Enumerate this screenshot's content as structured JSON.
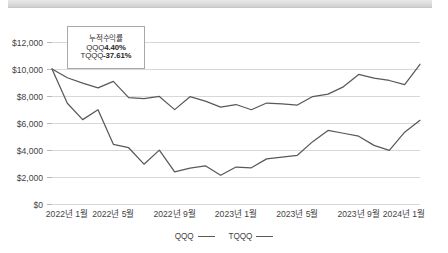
{
  "decor": {
    "top_bar_name": "top-scroll-bar"
  },
  "annotation": {
    "title": "누적수익률",
    "rows": [
      {
        "ticker": "QQQ",
        "value": "4.40%"
      },
      {
        "ticker": "TQQQ",
        "value": "-37.61%"
      }
    ]
  },
  "legend": {
    "items": [
      {
        "label": "QQQ",
        "color": "#595959"
      },
      {
        "label": "TQQQ",
        "color": "#595959"
      }
    ]
  },
  "chart_data": {
    "type": "line",
    "title": "",
    "subtitle": "",
    "xlabel": "",
    "ylabel": "",
    "ylim": [
      0,
      12000
    ],
    "yticks": [
      0,
      2000,
      4000,
      6000,
      8000,
      10000,
      12000
    ],
    "ytick_labels": [
      "$0",
      "$2,000",
      "$4,000",
      "$6,000",
      "$8,000",
      "$10,000",
      "$12,000"
    ],
    "grid": true,
    "legend_position": "bottom",
    "x_tick_labels": [
      "2022년 1월",
      "2022년 5월",
      "2022년 9월",
      "2023년 1월",
      "2023년 5월",
      "2023년 9월",
      "2024년 1월"
    ],
    "x_tick_indices": [
      0,
      4,
      8,
      12,
      16,
      20,
      24
    ],
    "x": [
      "2022-01",
      "2022-02",
      "2022-03",
      "2022-04",
      "2022-05",
      "2022-06",
      "2022-07",
      "2022-08",
      "2022-09",
      "2022-10",
      "2022-11",
      "2022-12",
      "2023-01",
      "2023-02",
      "2023-03",
      "2023-04",
      "2023-05",
      "2023-06",
      "2023-07",
      "2023-08",
      "2023-09",
      "2023-10",
      "2023-11",
      "2023-12",
      "2024-01"
    ],
    "series": [
      {
        "name": "QQQ",
        "color": "#595959",
        "values": [
          10000,
          9350,
          8950,
          8600,
          9080,
          7880,
          7800,
          7970,
          6990,
          7950,
          7620,
          7180,
          7370,
          6980,
          7480,
          7420,
          7330,
          7960,
          8140,
          8680,
          9600,
          9330,
          9150,
          8840,
          10350
        ]
      },
      {
        "name": "TQQQ",
        "color": "#595959",
        "values": [
          10000,
          7460,
          6250,
          6980,
          4420,
          4170,
          2950,
          3990,
          2380,
          2660,
          2830,
          2130,
          2740,
          2680,
          3340,
          3480,
          3610,
          4620,
          5450,
          5240,
          5020,
          4340,
          3970,
          5320,
          6200
        ]
      }
    ],
    "annotations": [
      {
        "text_lines": [
          "누적수익률",
          "QQQ 4.40%",
          "TQQQ -37.61%"
        ]
      }
    ]
  }
}
